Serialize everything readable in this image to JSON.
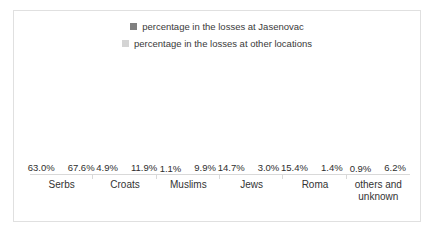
{
  "chart_data": {
    "type": "bar",
    "title": "",
    "xlabel": "",
    "ylabel": "",
    "grid": false,
    "legend_position": "top-center",
    "ylim": [
      0,
      75
    ],
    "categories": [
      "Serbs",
      "Croats",
      "Muslims",
      "Jews",
      "Roma",
      "others and\nunknown"
    ],
    "series": [
      {
        "name": "percentage in the losses at Jasenovac",
        "color": "#808080",
        "values": [
          63.0,
          4.9,
          1.1,
          14.7,
          15.4,
          0.9
        ],
        "labels": [
          "63.0%",
          "4.9%",
          "1.1%",
          "14.7%",
          "15.4%",
          "0.9%"
        ]
      },
      {
        "name": "percentage in the losses at other locations",
        "color": "#d4d4d4",
        "values": [
          67.6,
          11.9,
          9.9,
          3.0,
          1.4,
          6.2
        ],
        "labels": [
          "67.6%",
          "11.9%",
          "9.9%",
          "3.0%",
          "1.4%",
          "6.2%"
        ]
      }
    ]
  },
  "legend": {
    "items": [
      {
        "label": "percentage in the losses at Jasenovac",
        "color": "#808080"
      },
      {
        "label": "percentage in the losses at other locations",
        "color": "#d4d4d4"
      }
    ]
  },
  "axis": {
    "categories": [
      {
        "line1": "Serbs",
        "line2": ""
      },
      {
        "line1": "Croats",
        "line2": ""
      },
      {
        "line1": "Muslims",
        "line2": ""
      },
      {
        "line1": "Jews",
        "line2": ""
      },
      {
        "line1": "Roma",
        "line2": ""
      },
      {
        "line1": "others and",
        "line2": "unknown"
      }
    ]
  },
  "colors": {
    "series1": "#808080",
    "series2": "#d4d4d4",
    "frame": "#e0e0e0",
    "axis": "#d9d9d9",
    "text": "#333333",
    "background": "#ffffff"
  }
}
